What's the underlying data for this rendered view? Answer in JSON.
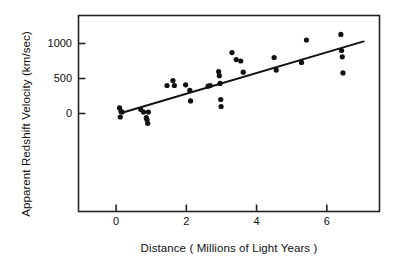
{
  "chart_data": {
    "type": "scatter",
    "title": "",
    "xlabel": "Distance   ( Millions of Light Years )",
    "ylabel": "Apparent Redshift Velocity  (km/sec)",
    "xlim": [
      -1.07,
      7.5
    ],
    "ylim": [
      -1400,
      1400
    ],
    "xticks": [
      0,
      2,
      4,
      6
    ],
    "xtick_labels": [
      "0",
      "2",
      "4",
      "6"
    ],
    "yticks": [
      0,
      500,
      1000
    ],
    "ytick_labels": [
      "0",
      "500",
      "1000"
    ],
    "grid": false,
    "legend": "none",
    "marker_color": "#111111",
    "line_color": "#111111",
    "axis_color": "#222222",
    "series": [
      {
        "name": "galaxies",
        "points": [
          [
            0.1,
            80
          ],
          [
            0.14,
            30
          ],
          [
            0.17,
            20
          ],
          [
            0.12,
            -50
          ],
          [
            0.7,
            60
          ],
          [
            0.78,
            20
          ],
          [
            0.92,
            20
          ],
          [
            0.86,
            -60
          ],
          [
            0.88,
            -90
          ],
          [
            0.9,
            -140
          ],
          [
            1.45,
            400
          ],
          [
            1.62,
            470
          ],
          [
            1.66,
            400
          ],
          [
            1.98,
            410
          ],
          [
            2.1,
            330
          ],
          [
            2.12,
            180
          ],
          [
            2.62,
            390
          ],
          [
            2.68,
            400
          ],
          [
            2.92,
            600
          ],
          [
            2.94,
            540
          ],
          [
            2.96,
            430
          ],
          [
            2.98,
            200
          ],
          [
            2.99,
            100
          ],
          [
            3.3,
            870
          ],
          [
            3.42,
            770
          ],
          [
            3.55,
            750
          ],
          [
            3.62,
            590
          ],
          [
            4.5,
            800
          ],
          [
            4.56,
            620
          ],
          [
            5.28,
            730
          ],
          [
            5.42,
            1050
          ],
          [
            6.4,
            1130
          ],
          [
            6.42,
            900
          ],
          [
            6.44,
            810
          ],
          [
            6.46,
            580
          ]
        ]
      }
    ],
    "trendline": {
      "name": "Hubble law fit",
      "x0": 0.17,
      "y0": 10,
      "x1": 7.05,
      "y1": 1030
    }
  }
}
